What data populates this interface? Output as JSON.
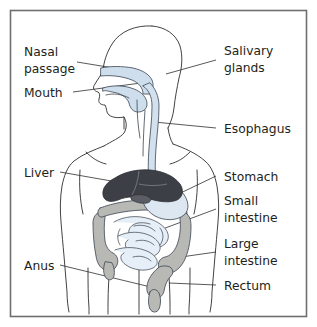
{
  "figure": {
    "background_color": "#ffffff",
    "frame_color": "#6e6e6e",
    "label_text_color": "#231f20",
    "leader_line_color": "#3b3b3b",
    "body_outline_color": "#2e2e2e"
  },
  "labels": {
    "nasal_passage": {
      "line1": "Nasal",
      "line2": "passage"
    },
    "mouth": {
      "line1": "Mouth"
    },
    "salivary_glands": {
      "line1": "Salivary",
      "line2": "glands"
    },
    "esophagus": {
      "line1": "Esophagus"
    },
    "liver": {
      "line1": "Liver"
    },
    "stomach": {
      "line1": "Stomach"
    },
    "small_intestine": {
      "line1": "Small",
      "line2": "intestine"
    },
    "large_intestine": {
      "line1": "Large",
      "line2": "intestine"
    },
    "rectum": {
      "line1": "Rectum"
    },
    "anus": {
      "line1": "Anus"
    }
  },
  "organs": {
    "liver": {
      "name": "liver",
      "color": "#3c3f45"
    },
    "stomach": {
      "name": "stomach",
      "color": "#dde7f2"
    },
    "small_intestine": {
      "name": "small-intestine",
      "color": "#e6eef7"
    },
    "large_intestine": {
      "name": "large-intestine",
      "color": "#b8b8b4"
    },
    "esophagus": {
      "name": "esophagus",
      "color": "#d3e0ee"
    },
    "nasal_cavity": {
      "name": "nasal-cavity",
      "color": "#cfdeed"
    },
    "oral_cavity": {
      "name": "oral-cavity",
      "color": "#cfdeed"
    }
  }
}
